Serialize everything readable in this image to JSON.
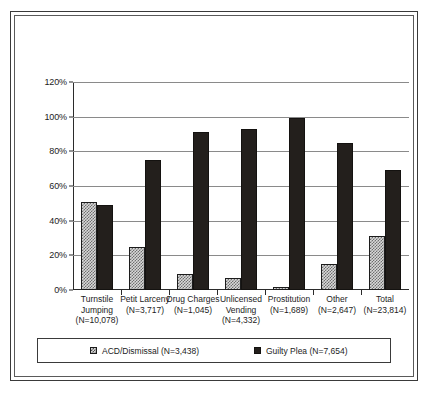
{
  "chart_data": {
    "type": "bar",
    "title": "",
    "xlabel": "",
    "ylabel": "",
    "ylim": [
      0,
      120
    ],
    "ytick_values": [
      0,
      20,
      40,
      60,
      80,
      100,
      120
    ],
    "ytick_labels": [
      "0%",
      "20%",
      "40%",
      "60%",
      "80%",
      "100%",
      "120%"
    ],
    "grid": true,
    "legend_position": "bottom",
    "categories": [
      "Turnstile Jumping",
      "Petit Larceny",
      "Drug Charges",
      "Unlicensed Vending",
      "Prostitution",
      "Other",
      "Total"
    ],
    "category_labels": [
      [
        "Turnstile",
        "Jumping",
        "(N=10,078)"
      ],
      [
        "Petit Larceny",
        "(N=3,717)"
      ],
      [
        "Drug Charges",
        "(N=1,045)"
      ],
      [
        "Unlicensed",
        "Vending",
        "(N=4,332)"
      ],
      [
        "Prostitution",
        "(N=1,689)"
      ],
      [
        "Other",
        "(N=2,647)"
      ],
      [
        "Total",
        "(N=23,814)"
      ]
    ],
    "category_n": [
      "10,078",
      "3,717",
      "1,045",
      "4,332",
      "1,689",
      "2,647",
      "23,814"
    ],
    "series": [
      {
        "name": "ACD/Dismissal (N=3,438)",
        "short_name": "ACD/Dismissal",
        "n": "3,438",
        "color": "#d8d8d8",
        "pattern": "checkered",
        "values": [
          51,
          25,
          9,
          7,
          2,
          15,
          31
        ]
      },
      {
        "name": "Guilty Plea (N=7,654)",
        "short_name": "Guilty Plea",
        "n": "7,654",
        "color": "#231f1c",
        "pattern": "solid",
        "values": [
          49,
          75,
          91,
          93,
          99,
          85,
          69
        ]
      }
    ]
  },
  "legend": {
    "items": [
      {
        "label": "ACD/Dismissal (N=3,438)",
        "swatch": "acd-swatch"
      },
      {
        "label": "Guilty Plea (N=7,654)",
        "swatch": "guilty-swatch"
      }
    ]
  }
}
